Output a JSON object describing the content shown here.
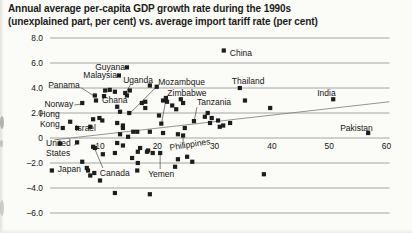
{
  "title": {
    "line1": "Annual average per-capita GDP growth rate during the 1990s",
    "line2": "(unexplained part, per cent) vs. average import tariff rate (per cent)"
  },
  "chart_data": {
    "type": "scatter",
    "title": "Annual average per-capita GDP growth rate during the 1990s (unexplained part, per cent) vs. average import tariff rate (per cent)",
    "xlabel": "average import tariff rate (per cent)",
    "ylabel": "annual average per-capita GDP growth rate in the 1990s, unexplained part (per cent)",
    "xlim": [
      -2,
      62
    ],
    "ylim": [
      -6,
      8
    ],
    "grid": "horizontal-only",
    "legend": "none",
    "marker_shape": "square",
    "marker_color": "#1d1d1d",
    "gridline_color": "#8f8f8b",
    "trend_color": "#7a7a76",
    "leader_color": "#4a4a46",
    "label_color": "#161614",
    "x_ticks": [
      {
        "v": 10,
        "label": "10"
      },
      {
        "v": 20,
        "label": "20"
      },
      {
        "v": 30,
        "label": "30"
      },
      {
        "v": 40,
        "label": "40"
      },
      {
        "v": 50,
        "label": "50"
      },
      {
        "v": 60,
        "label": "60"
      }
    ],
    "y_ticks": [
      {
        "v": 8,
        "label": "8.0"
      },
      {
        "v": 6,
        "label": "6.0"
      },
      {
        "v": 4,
        "label": "4.0"
      },
      {
        "v": 2,
        "label": "2.0"
      },
      {
        "v": 0,
        "label": "0"
      },
      {
        "v": -2,
        "label": "–2.0"
      },
      {
        "v": -4,
        "label": "–4.0"
      },
      {
        "v": -6,
        "label": "–6.0"
      }
    ],
    "trend_line": {
      "x1": 2.0,
      "y1": -0.15,
      "x2": 60.5,
      "y2": 2.9
    },
    "labeled_points": [
      {
        "name": "China",
        "x": 31.6,
        "y": 7.0,
        "label": {
          "dx": 6,
          "dy": 5,
          "anchor": "start"
        }
      },
      {
        "name": "Thailand",
        "x": 34.4,
        "y": 4.0,
        "label": {
          "dx": -8,
          "dy": -4,
          "anchor": "start"
        }
      },
      {
        "name": "India",
        "x": 50.7,
        "y": 3.1,
        "label": {
          "dx": -16,
          "dy": -3,
          "anchor": "start"
        }
      },
      {
        "name": "Pakistan",
        "x": 56.8,
        "y": 0.4,
        "label": {
          "dx": -28,
          "dy": -2,
          "anchor": "start"
        }
      },
      {
        "name": "Guyana",
        "x": 14.7,
        "y": 5.65,
        "label": {
          "dx": -2,
          "dy": 3,
          "anchor": "end"
        }
      },
      {
        "name": "Malaysia",
        "x": 13.3,
        "y": 5.0,
        "label": {
          "dx": -2,
          "dy": 2,
          "anchor": "end"
        }
      },
      {
        "name": "Uganda",
        "x": 14.4,
        "y": 3.6,
        "label": {
          "dx": -2,
          "dy": -10,
          "anchor": "start"
        },
        "leader": [
          5,
          -8
        ]
      },
      {
        "name": "Mozambque",
        "x": 15.1,
        "y": 2.0,
        "label": {
          "dx": 29,
          "dy": -28,
          "anchor": "start"
        },
        "leader": [
          28,
          -27
        ]
      },
      {
        "name": "Zimbabwe",
        "x": 20.7,
        "y": 1.15,
        "label": {
          "dx": 6,
          "dy": -28,
          "anchor": "start"
        },
        "leader": [
          5,
          -26
        ]
      },
      {
        "name": "Tanzania",
        "x": 26.4,
        "y": 1.35,
        "label": {
          "dx": 3,
          "dy": -16,
          "anchor": "start"
        },
        "leader": [
          3,
          -14
        ]
      },
      {
        "name": "Ghana",
        "x": 9.3,
        "y": 3.0,
        "label": {
          "dx": 6,
          "dy": 2,
          "anchor": "start"
        }
      },
      {
        "name": "Panama",
        "x": 9.1,
        "y": 3.4,
        "label": {
          "dx": -15,
          "dy": -8,
          "anchor": "end"
        },
        "leader": [
          -14,
          -8
        ]
      },
      {
        "name": "Norway",
        "x": 6.9,
        "y": 2.8,
        "label": {
          "dx": -9,
          "dy": 4,
          "anchor": "end"
        },
        "leader": [
          -8,
          2
        ]
      },
      {
        "name": "Hong Kong",
        "x": 3.5,
        "y": 0.8,
        "label": {
          "dx": -3,
          "dy": -11,
          "anchor": "end",
          "lines": [
            "Hong",
            "Kong"
          ]
        }
      },
      {
        "name": "Israel",
        "x": 4.8,
        "y": 1.3,
        "label": {
          "dx": 5,
          "dy": 9,
          "anchor": "start"
        }
      },
      {
        "name": "United States",
        "x": 6.0,
        "y": -0.35,
        "label": {
          "dx": -31,
          "dy": 4,
          "anchor": "start",
          "lines": [
            "United",
            "States"
          ]
        },
        "leader": [
          -3,
          3
        ]
      },
      {
        "name": "Japan",
        "x": 1.6,
        "y": -2.6,
        "label": {
          "dx": 6,
          "dy": 1,
          "anchor": "start"
        }
      },
      {
        "name": "Canada",
        "x": 9.1,
        "y": -0.8,
        "label": {
          "dx": 5,
          "dy": 28,
          "anchor": "start"
        },
        "leader": [
          8,
          20
        ]
      },
      {
        "name": "Yemen",
        "x": 20.5,
        "y": -1.2,
        "label": {
          "dx": -12,
          "dy": 24,
          "anchor": "start"
        },
        "leader": [
          0,
          16
        ]
      },
      {
        "name": "Philippines",
        "x": 24.5,
        "y": 0.2,
        "label": {
          "dx": -13,
          "dy": 15,
          "anchor": "start",
          "rotate": -9
        },
        "leader": [
          0,
          9
        ]
      }
    ],
    "points": [
      [
        10.9,
        3.8
      ],
      [
        11.7,
        3.85
      ],
      [
        12.6,
        3.7
      ],
      [
        10.7,
        3.35
      ],
      [
        14.7,
        3.4
      ],
      [
        15.2,
        3.8
      ],
      [
        13.0,
        2.5
      ],
      [
        13.5,
        2.1
      ],
      [
        17.3,
        2.8
      ],
      [
        17.9,
        2.4
      ],
      [
        8.8,
        1.5
      ],
      [
        9.9,
        1.6
      ],
      [
        10.4,
        1.4
      ],
      [
        18.7,
        4.2
      ],
      [
        19.9,
        4.1
      ],
      [
        17.9,
        2.9
      ],
      [
        21.0,
        3.0
      ],
      [
        21.7,
        2.9
      ],
      [
        24.5,
        2.8
      ],
      [
        21.5,
        3.2
      ],
      [
        24.1,
        3.1
      ],
      [
        22.6,
        2.6
      ],
      [
        23.3,
        2.3
      ],
      [
        20.3,
        1.8
      ],
      [
        28.3,
        1.7
      ],
      [
        28.8,
        2.0
      ],
      [
        29.5,
        1.6
      ],
      [
        30.6,
        1.4
      ],
      [
        29.2,
        1.2
      ],
      [
        31.5,
        1.0
      ],
      [
        30.9,
        0.9
      ],
      [
        32.7,
        1.2
      ],
      [
        13.0,
        1.2
      ],
      [
        14.0,
        1.0
      ],
      [
        14.0,
        0.8
      ],
      [
        13.5,
        0.3
      ],
      [
        14.9,
        0.1
      ],
      [
        15.8,
        0.5
      ],
      [
        16.5,
        0.5
      ],
      [
        18.7,
        0.5
      ],
      [
        21.0,
        0.4
      ],
      [
        23.6,
        0.3
      ],
      [
        24.8,
        0.8
      ],
      [
        8.3,
        0.9
      ],
      [
        6.0,
        0.8
      ],
      [
        35.3,
        3.0
      ],
      [
        39.7,
        2.4
      ],
      [
        3.0,
        -0.45
      ],
      [
        8.8,
        -0.7
      ],
      [
        10.5,
        -1.3
      ],
      [
        12.6,
        -1.2
      ],
      [
        13.0,
        -0.4
      ],
      [
        14.0,
        -0.6
      ],
      [
        15.6,
        -1.6
      ],
      [
        16.6,
        -1.1
      ],
      [
        17.0,
        -0.8
      ],
      [
        18.2,
        -1.1
      ],
      [
        18.4,
        -1.0
      ],
      [
        19.2,
        -1.2
      ],
      [
        23.1,
        -2.3
      ],
      [
        23.6,
        -1.7
      ],
      [
        25.2,
        -1.5
      ],
      [
        26.1,
        -1.9
      ],
      [
        16.6,
        -2.0
      ],
      [
        16.5,
        -2.6
      ],
      [
        6.9,
        -1.9
      ],
      [
        7.7,
        -2.4
      ],
      [
        7.9,
        -2.6
      ],
      [
        9.0,
        -2.8
      ],
      [
        8.3,
        -3.0
      ],
      [
        10.0,
        -3.4
      ],
      [
        12.6,
        -4.4
      ],
      [
        18.7,
        -4.5
      ],
      [
        38.6,
        -2.9
      ]
    ]
  },
  "scan": {
    "edge_color": "#9a9a92"
  }
}
